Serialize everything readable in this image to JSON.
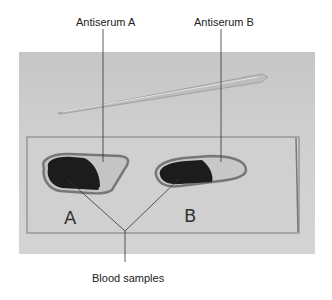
{
  "figure": {
    "labels": {
      "antiserum_a": "Antiserum A",
      "antiserum_b": "Antiserum B",
      "blood_samples": "Blood samples"
    },
    "slide_marks": {
      "left": "A",
      "right": "B"
    },
    "colors": {
      "background": "#ffffff",
      "photo_bg": "#cccccc",
      "slide_edge": "#8a8a8a",
      "blood": "#1a1a1a",
      "leader_line": "#333333"
    }
  }
}
